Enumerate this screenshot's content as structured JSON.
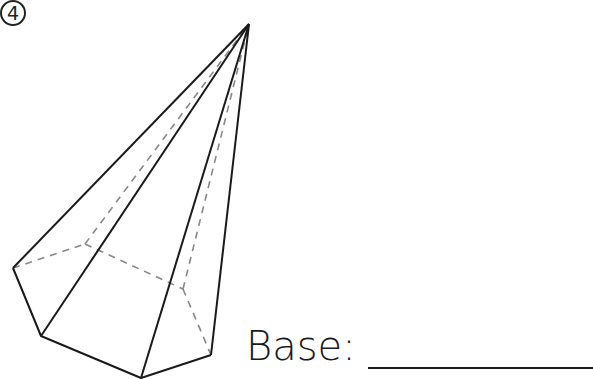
{
  "problem": {
    "number": "4",
    "base_label": "Base:",
    "answer": ""
  },
  "figure": {
    "shape": "pentagonal pyramid",
    "apex": [
      249,
      24
    ],
    "visible_base_vertices": [
      [
        13,
        268
      ],
      [
        41,
        336
      ],
      [
        141,
        378
      ],
      [
        211,
        355
      ]
    ],
    "hidden_base_vertices": [
      [
        85,
        244
      ],
      [
        183,
        289
      ]
    ],
    "line_color": "#1a1a1a",
    "hidden_line_color": "#888888"
  }
}
